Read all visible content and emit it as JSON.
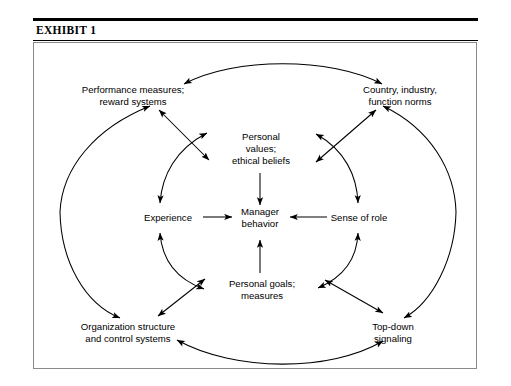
{
  "exhibit": {
    "title": "EXHIBIT 1"
  },
  "diagram": {
    "type": "influence-diagram",
    "center_node": {
      "id": "manager-behavior",
      "lines": [
        "Manager",
        "behavior"
      ],
      "x": 255,
      "y": 218
    },
    "inner_nodes": [
      {
        "id": "personal-values",
        "lines": [
          "Personal",
          "values;",
          "ethical beliefs"
        ],
        "x": 260,
        "y": 142,
        "position": "top"
      },
      {
        "id": "experience",
        "lines": [
          "Experience"
        ],
        "x": 168,
        "y": 218,
        "position": "left"
      },
      {
        "id": "sense-of-role",
        "lines": [
          "Sense of role"
        ],
        "x": 358,
        "y": 218,
        "position": "right"
      },
      {
        "id": "personal-goals",
        "lines": [
          "Personal goals;",
          "measures"
        ],
        "x": 262,
        "y": 287,
        "position": "bottom"
      }
    ],
    "outer_nodes": [
      {
        "id": "performance-measures",
        "lines": [
          "Performance measures;",
          "reward systems"
        ],
        "x": 133,
        "y": 93,
        "position": "top-left"
      },
      {
        "id": "country-industry-norms",
        "lines": [
          "Country, industry,",
          "function norms"
        ],
        "x": 400,
        "y": 93,
        "position": "top-right"
      },
      {
        "id": "organization-structure",
        "lines": [
          "Organization structure",
          "and control systems"
        ],
        "x": 128,
        "y": 330,
        "position": "bottom-left"
      },
      {
        "id": "top-down-signaling",
        "lines": [
          "Top-down",
          "signaling"
        ],
        "x": 393,
        "y": 330,
        "position": "bottom-right"
      }
    ],
    "edges": [
      {
        "from": "personal-values",
        "to": "manager-behavior",
        "style": "straight",
        "heads": "single"
      },
      {
        "from": "experience",
        "to": "manager-behavior",
        "style": "straight",
        "heads": "single"
      },
      {
        "from": "sense-of-role",
        "to": "manager-behavior",
        "style": "straight",
        "heads": "single"
      },
      {
        "from": "personal-goals",
        "to": "manager-behavior",
        "style": "straight",
        "heads": "single"
      },
      {
        "from": "experience",
        "to": "personal-values",
        "style": "arc",
        "heads": "double"
      },
      {
        "from": "personal-values",
        "to": "sense-of-role",
        "style": "arc",
        "heads": "double"
      },
      {
        "from": "sense-of-role",
        "to": "personal-goals",
        "style": "arc",
        "heads": "double"
      },
      {
        "from": "personal-goals",
        "to": "experience",
        "style": "arc",
        "heads": "double"
      },
      {
        "from": "performance-measures",
        "to": "country-industry-norms",
        "style": "arc",
        "heads": "double"
      },
      {
        "from": "organization-structure",
        "to": "top-down-signaling",
        "style": "arc",
        "heads": "double"
      },
      {
        "from": "performance-measures",
        "to": "personal-values",
        "style": "straight",
        "heads": "double"
      },
      {
        "from": "country-industry-norms",
        "to": "personal-values",
        "style": "straight",
        "heads": "double"
      },
      {
        "from": "organization-structure",
        "to": "personal-goals",
        "style": "straight",
        "heads": "double"
      },
      {
        "from": "top-down-signaling",
        "to": "personal-goals",
        "style": "straight",
        "heads": "double"
      },
      {
        "from": "performance-measures",
        "to": "experience",
        "style": "ellipse",
        "heads": "double"
      },
      {
        "from": "country-industry-norms",
        "to": "sense-of-role",
        "style": "ellipse",
        "heads": "double"
      },
      {
        "from": "organization-structure",
        "to": "experience",
        "style": "ellipse",
        "heads": "double"
      },
      {
        "from": "top-down-signaling",
        "to": "sense-of-role",
        "style": "ellipse",
        "heads": "double"
      }
    ],
    "colors": {
      "stroke": "#000000",
      "text": "#000000",
      "frame": "#8a8a8a",
      "background": "#ffffff"
    }
  }
}
